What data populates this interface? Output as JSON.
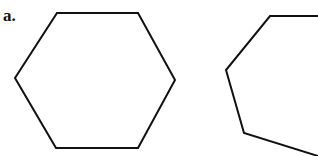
{
  "figure": {
    "label": "a.",
    "background_color": "#ffffff",
    "stroke_color": "#111111",
    "stroke_width": 2,
    "canvas": {
      "width": 318,
      "height": 156
    },
    "shapes": [
      {
        "name": "hexagon",
        "sides": 6,
        "closed": true,
        "points": "57,13 138,13 175,80 138,148 56,148 15,78"
      },
      {
        "name": "partial-polygon",
        "sides": 7,
        "closed": false,
        "points": "318,16 270,16 226,70 244,133 318,156"
      }
    ]
  }
}
